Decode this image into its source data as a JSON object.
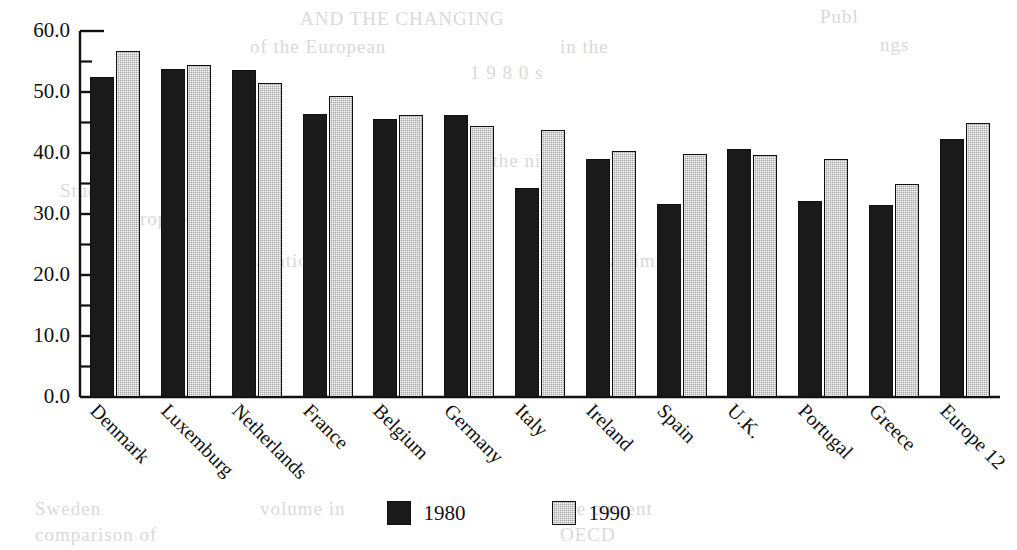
{
  "chart_data": {
    "type": "bar",
    "title": "",
    "subtitle": "",
    "xlabel": "",
    "ylabel": "",
    "ylim": [
      0.0,
      60.0
    ],
    "ytick_labels": [
      "60.0",
      "50.0",
      "40.0",
      "30.0",
      "20.0",
      "10.0",
      "0.0"
    ],
    "ytick_values": [
      60.0,
      50.0,
      40.0,
      30.0,
      20.0,
      10.0,
      0.0
    ],
    "minor_ticks": true,
    "grid": false,
    "legend_position": "bottom-center",
    "categories": [
      "Denmark",
      "Luxemburg",
      "Netherlands",
      "France",
      "Belgium",
      "Germany",
      "Italy",
      "Ireland",
      "Spain",
      "U.K.",
      "Portugal",
      "Greece",
      "Europe 12"
    ],
    "series": [
      {
        "name": "1980",
        "color": "#1a1a1a",
        "values": [
          52.5,
          53.7,
          53.6,
          46.4,
          45.5,
          46.3,
          34.2,
          39.0,
          31.6,
          40.6,
          32.2,
          31.5,
          42.3
        ]
      },
      {
        "name": "1990",
        "color": "#a6a6a6",
        "values": [
          56.8,
          54.4,
          51.5,
          49.3,
          46.2,
          44.5,
          43.7,
          40.4,
          39.9,
          39.7,
          39.0,
          35.0,
          45.0
        ]
      }
    ]
  },
  "legend": {
    "entries": [
      {
        "label": "1980",
        "swatch": "black-square-swatch"
      },
      {
        "label": "1990",
        "swatch": "gray-square-swatch"
      }
    ]
  },
  "bleed_text": [
    {
      "text": "AND THE CHANGING",
      "x": 300,
      "y": 8
    },
    {
      "text": "of the European",
      "x": 250,
      "y": 36
    },
    {
      "text": "in the",
      "x": 560,
      "y": 36
    },
    {
      "text": "1 9 8 0 s",
      "x": 470,
      "y": 62
    },
    {
      "text": "Publ",
      "x": 820,
      "y": 6
    },
    {
      "text": "ngs",
      "x": 880,
      "y": 34
    },
    {
      "text": "Stud",
      "x": 60,
      "y": 180
    },
    {
      "text": "europeen",
      "x": 120,
      "y": 208
    },
    {
      "text": "in the nine",
      "x": 470,
      "y": 150
    },
    {
      "text": "taxation",
      "x": 250,
      "y": 250
    },
    {
      "text": "a similar",
      "x": 610,
      "y": 250
    },
    {
      "text": "Sweden",
      "x": 35,
      "y": 498
    },
    {
      "text": "volume in",
      "x": 260,
      "y": 498
    },
    {
      "text": "the current",
      "x": 560,
      "y": 498
    },
    {
      "text": "comparison of",
      "x": 35,
      "y": 524
    },
    {
      "text": "OECD",
      "x": 560,
      "y": 524
    }
  ]
}
